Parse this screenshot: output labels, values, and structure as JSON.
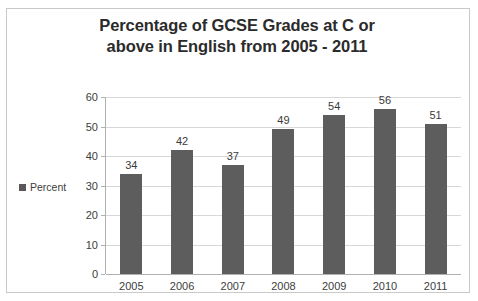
{
  "chart_data": {
    "type": "bar",
    "title": "Percentage of GCSE Grades at C or above in English from 2005 - 2011",
    "title_lines": [
      "Percentage of GCSE Grades at C or",
      "above in English from 2005 - 2011"
    ],
    "categories": [
      "2005",
      "2006",
      "2007",
      "2008",
      "2009",
      "2010",
      "2011"
    ],
    "series": [
      {
        "name": "Percent",
        "values": [
          34,
          42,
          37,
          49,
          54,
          56,
          51
        ],
        "color": "#5d5d5d"
      }
    ],
    "values": [
      34,
      42,
      37,
      49,
      54,
      56,
      51
    ],
    "data_labels": [
      "34",
      "42",
      "37",
      "49",
      "54",
      "56",
      "51"
    ],
    "xlabel": "",
    "ylabel": "",
    "ylim": [
      0,
      60
    ],
    "yticks": [
      0,
      10,
      20,
      30,
      40,
      50,
      60
    ],
    "ytick_labels": [
      "0",
      "10",
      "20",
      "30",
      "40",
      "50",
      "60"
    ],
    "grid": true,
    "legend_position": "left",
    "legend_entries": [
      "Percent"
    ]
  },
  "colors": {
    "bar": "#5d5d5d",
    "grid": "#d8d8d8",
    "axis": "#b0b0b0",
    "frame_border": "#c9c9c9",
    "title_text": "#2b2b2b",
    "tick_text": "#3d3d3d",
    "background": "#ffffff"
  }
}
